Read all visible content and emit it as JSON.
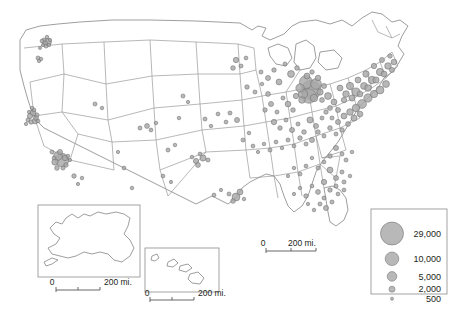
{
  "map": {
    "title": "US population-distribution dot map",
    "background_color": "#ffffff",
    "state_border_color": "#9a9a9a",
    "coast_color": "#8c8c8c",
    "bubble_fill": "#a8a8a8",
    "bubble_stroke": "#6e6e6e"
  },
  "legend": {
    "name": "bubble-size-legend",
    "entries": [
      {
        "label": "29,000",
        "value": 29000,
        "radius": 11.5
      },
      {
        "label": "10,000",
        "value": 10000,
        "radius": 6.8
      },
      {
        "label": "5,000",
        "value": 5000,
        "radius": 4.8
      },
      {
        "label": "2,000",
        "value": 2000,
        "radius": 3.0
      },
      {
        "label": "500",
        "value": 500,
        "radius": 1.5
      }
    ]
  },
  "scalebars": {
    "main": {
      "zero": "0",
      "label": "200 mi."
    },
    "alaska": {
      "zero": "0",
      "label": "200 mi."
    },
    "hawaii": {
      "zero": "0",
      "label": "200 mi."
    }
  },
  "insets": {
    "alaska": {
      "name": "alaska-inset"
    },
    "hawaii": {
      "name": "hawaii-inset"
    }
  },
  "chart_data": {
    "type": "scatter",
    "xlabel": "",
    "ylabel": "",
    "legend_position": "bottom-right",
    "size_legend": [
      29000,
      10000,
      5000,
      2000,
      500
    ],
    "points": [
      [
        44,
        40,
        900
      ],
      [
        47,
        37,
        700
      ],
      [
        45,
        43,
        1400
      ],
      [
        48,
        42,
        2600
      ],
      [
        43,
        45,
        600
      ],
      [
        40,
        48,
        500
      ],
      [
        46,
        46,
        900
      ],
      [
        49,
        45,
        700
      ],
      [
        42,
        41,
        800
      ],
      [
        50,
        40,
        600
      ],
      [
        38,
        58,
        900
      ],
      [
        41,
        59,
        700
      ],
      [
        39,
        61,
        600
      ],
      [
        30,
        116,
        1500
      ],
      [
        33,
        113,
        2100
      ],
      [
        36,
        118,
        1300
      ],
      [
        28,
        120,
        900
      ],
      [
        35,
        121,
        1800
      ],
      [
        31,
        122,
        1100
      ],
      [
        34,
        110,
        800
      ],
      [
        29,
        112,
        600
      ],
      [
        37,
        115,
        900
      ],
      [
        32,
        108,
        700
      ],
      [
        26,
        124,
        600
      ],
      [
        38,
        121,
        800
      ],
      [
        52,
        152,
        900
      ],
      [
        58,
        156,
        4200
      ],
      [
        62,
        160,
        9800
      ],
      [
        55,
        162,
        2200
      ],
      [
        60,
        152,
        1400
      ],
      [
        65,
        158,
        1600
      ],
      [
        57,
        168,
        1200
      ],
      [
        63,
        168,
        900
      ],
      [
        68,
        156,
        700
      ],
      [
        66,
        165,
        1100
      ],
      [
        70,
        160,
        600
      ],
      [
        54,
        158,
        800
      ],
      [
        74,
        176,
        1100
      ],
      [
        78,
        184,
        600
      ],
      [
        82,
        178,
        700
      ],
      [
        95,
        104,
        900
      ],
      [
        102,
        108,
        700
      ],
      [
        140,
        128,
        900
      ],
      [
        147,
        126,
        1300
      ],
      [
        151,
        130,
        800
      ],
      [
        156,
        123,
        700
      ],
      [
        124,
        168,
        800
      ],
      [
        118,
        152,
        600
      ],
      [
        132,
        188,
        700
      ],
      [
        183,
        96,
        900
      ],
      [
        179,
        118,
        700
      ],
      [
        188,
        102,
        600
      ],
      [
        196,
        161,
        1500
      ],
      [
        203,
        158,
        2100
      ],
      [
        198,
        165,
        1300
      ],
      [
        208,
        160,
        900
      ],
      [
        200,
        154,
        800
      ],
      [
        192,
        157,
        700
      ],
      [
        214,
        195,
        800
      ],
      [
        221,
        190,
        600
      ],
      [
        236,
        197,
        3400
      ],
      [
        240,
        192,
        1900
      ],
      [
        233,
        201,
        1200
      ],
      [
        229,
        194,
        900
      ],
      [
        244,
        199,
        700
      ],
      [
        168,
        150,
        900
      ],
      [
        175,
        145,
        700
      ],
      [
        163,
        176,
        800
      ],
      [
        171,
        182,
        600
      ],
      [
        205,
        119,
        900
      ],
      [
        211,
        126,
        700
      ],
      [
        218,
        114,
        800
      ],
      [
        230,
        113,
        900
      ],
      [
        237,
        120,
        1400
      ],
      [
        226,
        122,
        800
      ],
      [
        243,
        140,
        900
      ],
      [
        249,
        133,
        700
      ],
      [
        253,
        146,
        800
      ],
      [
        247,
        87,
        1100
      ],
      [
        255,
        92,
        900
      ],
      [
        262,
        84,
        700
      ],
      [
        268,
        94,
        1300
      ],
      [
        236,
        60,
        1600
      ],
      [
        241,
        66,
        900
      ],
      [
        233,
        68,
        1200
      ],
      [
        246,
        58,
        800
      ],
      [
        261,
        72,
        900
      ],
      [
        268,
        78,
        1400
      ],
      [
        274,
        70,
        1100
      ],
      [
        279,
        82,
        1900
      ],
      [
        285,
        64,
        900
      ],
      [
        291,
        74,
        2600
      ],
      [
        297,
        68,
        1200
      ],
      [
        300,
        88,
        3800
      ],
      [
        306,
        82,
        9200
      ],
      [
        311,
        90,
        21000
      ],
      [
        316,
        84,
        6400
      ],
      [
        309,
        96,
        11500
      ],
      [
        303,
        94,
        4700
      ],
      [
        314,
        98,
        3100
      ],
      [
        320,
        92,
        2200
      ],
      [
        318,
        78,
        1700
      ],
      [
        324,
        86,
        1400
      ],
      [
        307,
        76,
        1900
      ],
      [
        312,
        72,
        1100
      ],
      [
        302,
        100,
        2400
      ],
      [
        296,
        96,
        1600
      ],
      [
        322,
        100,
        1300
      ],
      [
        288,
        104,
        1800
      ],
      [
        293,
        110,
        1200
      ],
      [
        283,
        98,
        900
      ],
      [
        271,
        104,
        1400
      ],
      [
        277,
        112,
        900
      ],
      [
        265,
        110,
        1100
      ],
      [
        274,
        122,
        1600
      ],
      [
        280,
        128,
        1100
      ],
      [
        286,
        120,
        900
      ],
      [
        292,
        130,
        1400
      ],
      [
        298,
        124,
        900
      ],
      [
        304,
        132,
        1200
      ],
      [
        310,
        120,
        2100
      ],
      [
        316,
        126,
        1400
      ],
      [
        322,
        118,
        900
      ],
      [
        328,
        96,
        2600
      ],
      [
        334,
        102,
        1900
      ],
      [
        330,
        108,
        1300
      ],
      [
        326,
        112,
        1100
      ],
      [
        332,
        118,
        900
      ],
      [
        338,
        110,
        1400
      ],
      [
        340,
        88,
        1900
      ],
      [
        346,
        94,
        2400
      ],
      [
        344,
        100,
        1600
      ],
      [
        350,
        86,
        2900
      ],
      [
        356,
        92,
        3600
      ],
      [
        352,
        98,
        2100
      ],
      [
        358,
        80,
        1900
      ],
      [
        364,
        86,
        2600
      ],
      [
        360,
        94,
        1800
      ],
      [
        366,
        74,
        2200
      ],
      [
        372,
        80,
        3100
      ],
      [
        368,
        88,
        2400
      ],
      [
        374,
        66,
        1600
      ],
      [
        380,
        72,
        2900
      ],
      [
        376,
        80,
        2100
      ],
      [
        382,
        60,
        1400
      ],
      [
        388,
        66,
        2400
      ],
      [
        384,
        74,
        1900
      ],
      [
        390,
        56,
        1100
      ],
      [
        394,
        62,
        1800
      ],
      [
        392,
        70,
        1400
      ],
      [
        386,
        84,
        2600
      ],
      [
        380,
        90,
        3400
      ],
      [
        374,
        94,
        2900
      ],
      [
        368,
        98,
        3800
      ],
      [
        362,
        104,
        4200
      ],
      [
        356,
        108,
        3100
      ],
      [
        350,
        112,
        2400
      ],
      [
        344,
        116,
        1900
      ],
      [
        338,
        122,
        1400
      ],
      [
        354,
        118,
        2100
      ],
      [
        360,
        114,
        1800
      ],
      [
        348,
        124,
        1300
      ],
      [
        342,
        130,
        1100
      ],
      [
        336,
        134,
        900
      ],
      [
        330,
        128,
        1200
      ],
      [
        324,
        136,
        900
      ],
      [
        318,
        132,
        1100
      ],
      [
        312,
        140,
        1400
      ],
      [
        306,
        144,
        900
      ],
      [
        300,
        138,
        1100
      ],
      [
        294,
        146,
        800
      ],
      [
        288,
        140,
        900
      ],
      [
        282,
        148,
        700
      ],
      [
        276,
        142,
        800
      ],
      [
        270,
        150,
        900
      ],
      [
        264,
        144,
        700
      ],
      [
        258,
        152,
        600
      ],
      [
        336,
        148,
        1400
      ],
      [
        342,
        154,
        900
      ],
      [
        330,
        156,
        1100
      ],
      [
        346,
        160,
        900
      ],
      [
        352,
        152,
        700
      ],
      [
        324,
        162,
        800
      ],
      [
        318,
        168,
        900
      ],
      [
        312,
        158,
        700
      ],
      [
        306,
        166,
        800
      ],
      [
        300,
        174,
        900
      ],
      [
        294,
        168,
        700
      ],
      [
        288,
        176,
        600
      ],
      [
        330,
        170,
        1900
      ],
      [
        336,
        178,
        1400
      ],
      [
        342,
        172,
        900
      ],
      [
        324,
        182,
        1600
      ],
      [
        330,
        190,
        1100
      ],
      [
        336,
        186,
        900
      ],
      [
        318,
        192,
        1300
      ],
      [
        324,
        198,
        900
      ],
      [
        312,
        186,
        800
      ],
      [
        306,
        196,
        1100
      ],
      [
        300,
        188,
        700
      ],
      [
        294,
        194,
        600
      ],
      [
        344,
        182,
        900
      ],
      [
        350,
        176,
        700
      ],
      [
        338,
        194,
        800
      ],
      [
        332,
        202,
        900
      ],
      [
        326,
        208,
        1400
      ],
      [
        320,
        204,
        900
      ],
      [
        314,
        210,
        700
      ],
      [
        308,
        204,
        600
      ],
      [
        344,
        190,
        800
      ]
    ]
  }
}
